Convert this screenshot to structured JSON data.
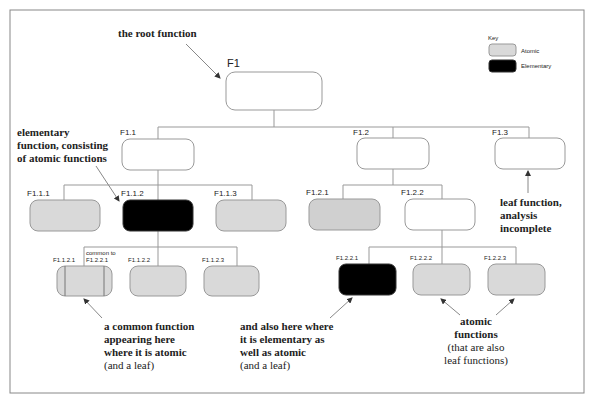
{
  "diagram": {
    "title_annotation": "the root function",
    "key": {
      "title": "Key",
      "items": [
        {
          "label": "Atomic",
          "color": "#d9d9d9"
        },
        {
          "label": "Elementary",
          "color": "#000000"
        }
      ]
    },
    "nodes": {
      "F1": {
        "label": "F1",
        "type": "plain"
      },
      "F1_1": {
        "label": "F1.1",
        "type": "plain"
      },
      "F1_2": {
        "label": "F1.2",
        "type": "plain"
      },
      "F1_3": {
        "label": "F1.3",
        "type": "plain"
      },
      "F1_1_1": {
        "label": "F1.1.1",
        "type": "atomic"
      },
      "F1_1_2": {
        "label": "F1.1.2",
        "type": "elementary"
      },
      "F1_1_3": {
        "label": "F1.1.3",
        "type": "atomic"
      },
      "F1_2_1": {
        "label": "F1.2.1",
        "type": "atomic"
      },
      "F1_2_2": {
        "label": "F1.2.2",
        "type": "plain"
      },
      "F1_1_2_1": {
        "label": "F1.1.2.1",
        "type": "atomic-common",
        "common_note": "common to",
        "common_ref": "F1.2.2.1"
      },
      "F1_1_2_2": {
        "label": "F1.1.2.2",
        "type": "atomic"
      },
      "F1_1_2_3": {
        "label": "F1.1.2.3",
        "type": "atomic"
      },
      "F1_2_2_1": {
        "label": "F1.2.2.1",
        "type": "elementary"
      },
      "F1_2_2_2": {
        "label": "F1.2.2.2",
        "type": "atomic"
      },
      "F1_2_2_3": {
        "label": "F1.2.2.3",
        "type": "atomic"
      }
    },
    "annotations": {
      "elementary": [
        "elementary",
        "function, consisting",
        "of atomic functions"
      ],
      "leaf": [
        "leaf function,",
        "analysis",
        "incomplete"
      ],
      "common": [
        "a common function",
        "appearing here",
        "where it is atomic",
        "(and a leaf)"
      ],
      "also_here": [
        "and also here where",
        "it is elementary as",
        "well as atomic",
        "(and a leaf)"
      ],
      "atomic_leaf": [
        "atomic",
        "functions",
        "(that are also",
        "leaf functions)"
      ]
    },
    "colors": {
      "atomic_fill": "#d9d9d9",
      "elementary_fill": "#000000",
      "plain_fill": "#ffffff",
      "stroke": "#999999",
      "frame": "#888888"
    }
  }
}
